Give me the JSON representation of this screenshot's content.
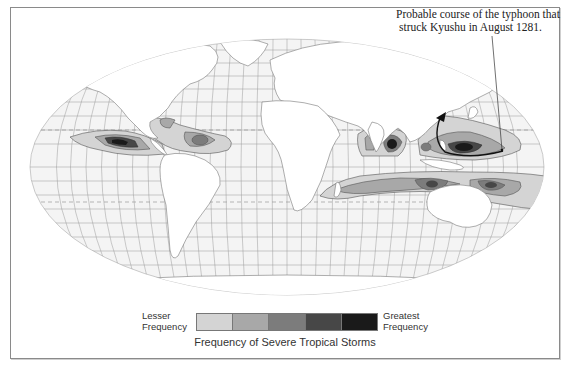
{
  "annotation": {
    "line1": "Probable course of the typhoon that",
    "line2": "struck Kyushu in August 1281."
  },
  "legend": {
    "lesser_line1": "Lesser",
    "lesser_line2": "Frequency",
    "greatest_line1": "Greatest",
    "greatest_line2": "Frequency",
    "title": "Frequency of Severe Tropical Storms",
    "swatches": [
      {
        "level": 1,
        "color": "#d4d4d4"
      },
      {
        "level": 2,
        "color": "#a8a8a8"
      },
      {
        "level": 3,
        "color": "#7c7c7c"
      },
      {
        "level": 4,
        "color": "#474747"
      },
      {
        "level": 5,
        "color": "#1a1a1a"
      }
    ]
  },
  "map": {
    "projection": "Robinson-style world map",
    "ocean_color": "#f4f4f4",
    "land_color": "#ffffff",
    "grid_color": "#9a9a9a",
    "storm_regions": [
      "Eastern North Pacific",
      "North Atlantic / Caribbean",
      "Bay of Bengal",
      "Western North Pacific",
      "South Indian Ocean",
      "Southwest Pacific / Australia"
    ],
    "typhoon_path": "Western North Pacific toward Kyushu, Japan"
  }
}
